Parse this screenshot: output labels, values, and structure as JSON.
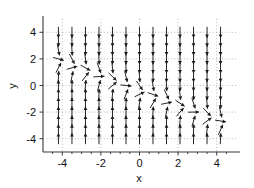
{
  "figure": {
    "background_color": "#ffffff",
    "foreground_color": "#1a1a1a",
    "grid_color": "#9a9a9a",
    "axis_color": "#3a3a3a"
  },
  "chart_data": {
    "type": "scatter",
    "plot_kind": "direction-field-quiver",
    "title": "",
    "subtitle": "",
    "xlabel": "x",
    "ylabel": "y",
    "xlim": [
      -5,
      5
    ],
    "ylim": [
      -5,
      5
    ],
    "xticks": [
      -4,
      -2,
      0,
      2,
      4
    ],
    "yticks": [
      -4,
      -2,
      0,
      2,
      4
    ],
    "xticklabels": [
      "-4",
      "-2",
      "0",
      "2",
      "4"
    ],
    "yticklabels": [
      "-4",
      "-2",
      "0",
      "2",
      "4"
    ],
    "minor_xticks": [
      -4.5,
      -3.5,
      -3,
      -2.5,
      -1.5,
      -1,
      -0.5,
      0.5,
      1,
      1.5,
      2.5,
      3,
      3.5,
      4.5
    ],
    "grid": true,
    "grid_style": "dotted",
    "legend": null,
    "legend_position": "none",
    "annotations": [],
    "field": {
      "description": "Slope field: arrows point downward above the nullcline and upward below it; arrows flatten to horizontal along the nullcline.",
      "grid_x": [
        -4.2,
        -3.5,
        -2.8,
        -2.1,
        -1.4,
        -0.7,
        0,
        0.7,
        1.4,
        2.1,
        2.8,
        3.5,
        4.2
      ],
      "grid_y": [
        -4.0,
        -3.33,
        -2.67,
        -2.0,
        -1.33,
        -0.67,
        0,
        0.67,
        1.33,
        2.0,
        2.67,
        3.33,
        4.0
      ],
      "nullcline_slope": -0.55,
      "nullcline_intercept": -0.45,
      "slope_gain": 1.45,
      "arrow_length_px": 11,
      "columns": 13,
      "rows": 13
    }
  }
}
